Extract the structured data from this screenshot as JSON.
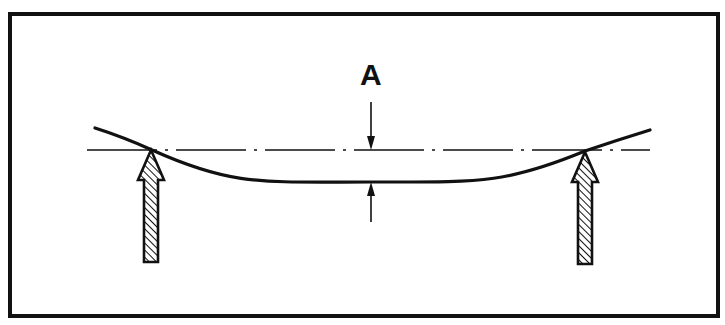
{
  "diagram": {
    "dimension_label": "A",
    "colors": {
      "ink": "#111111",
      "background": "#ffffff"
    },
    "frame": {
      "x": 10,
      "y": 14,
      "width": 708,
      "height": 302,
      "stroke": 4
    },
    "datum_line": {
      "x1": 87,
      "x2": 650,
      "y": 150,
      "style": "dash-dot"
    },
    "beam_curve": {
      "start": [
        95,
        128
      ],
      "left_support_contact": [
        152,
        150
      ],
      "lowest_point": [
        370,
        182
      ],
      "right_support_contact": [
        585,
        151
      ],
      "end": [
        650,
        130
      ]
    },
    "supports": [
      {
        "name": "left-support",
        "cx": 151,
        "tip_y": 150,
        "bottom_y": 262
      },
      {
        "name": "right-support",
        "cx": 585,
        "tip_y": 152,
        "bottom_y": 264
      }
    ],
    "dimension": {
      "x": 371,
      "label_pos": [
        360,
        60
      ],
      "upper_arrow": {
        "from_y": 102,
        "to_y": 150
      },
      "lower_arrow": {
        "from_y": 222,
        "to_y": 182
      }
    }
  }
}
